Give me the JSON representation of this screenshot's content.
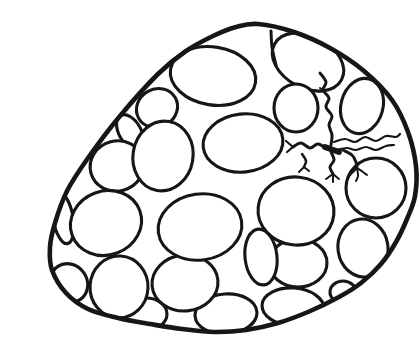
{
  "illustration": {
    "subject": "black-and-white line drawing of an egg sac (ovary cross-section) packed with oval eggs, with small branching vessel squiggles at the upper right",
    "canvas": {
      "width": 380,
      "height": 319
    },
    "colors": {
      "background": "#ffffff",
      "ink": "#161616",
      "egg_fill": "#ffffff"
    },
    "sac_outline": {
      "stroke_width": 4.6,
      "points": [
        [
          218,
          8
        ],
        [
          254,
          16
        ],
        [
          290,
          32
        ],
        [
          324,
          55
        ],
        [
          352,
          84
        ],
        [
          368,
          116
        ],
        [
          376,
          150
        ],
        [
          375,
          180
        ],
        [
          367,
          203
        ],
        [
          356,
          226
        ],
        [
          341,
          248
        ],
        [
          321,
          267
        ],
        [
          299,
          281
        ],
        [
          268,
          296
        ],
        [
          238,
          307
        ],
        [
          206,
          314
        ],
        [
          174,
          316
        ],
        [
          142,
          313
        ],
        [
          110,
          308
        ],
        [
          78,
          302
        ],
        [
          48,
          293
        ],
        [
          26,
          277
        ],
        [
          12,
          254
        ],
        [
          10,
          231
        ],
        [
          15,
          207
        ],
        [
          27,
          175
        ],
        [
          48,
          142
        ],
        [
          80,
          100
        ],
        [
          118,
          58
        ],
        [
          146,
          35
        ],
        [
          173,
          20
        ],
        [
          196,
          11
        ]
      ]
    },
    "eggs": {
      "stroke_width": 3.1,
      "items": [
        {
          "cx": 90,
          "cy": 116,
          "rx": 11,
          "ry": 19,
          "rot": -30
        },
        {
          "cx": 117,
          "cy": 92,
          "rx": 21,
          "ry": 19,
          "rot": -30
        },
        {
          "cx": 173,
          "cy": 60,
          "rx": 43,
          "ry": 29,
          "rot": 9
        },
        {
          "cx": 268,
          "cy": 46,
          "rx": 38,
          "ry": 26,
          "rot": 28
        },
        {
          "cx": 256,
          "cy": 92,
          "rx": 22,
          "ry": 24,
          "rot": 0
        },
        {
          "cx": 322,
          "cy": 90,
          "rx": 21,
          "ry": 28,
          "rot": 15
        },
        {
          "cx": 23,
          "cy": 202,
          "rx": 10,
          "ry": 26,
          "rot": -10
        },
        {
          "cx": 77,
          "cy": 150,
          "rx": 27,
          "ry": 25,
          "rot": -15
        },
        {
          "cx": 123,
          "cy": 140,
          "rx": 30,
          "ry": 35,
          "rot": 10
        },
        {
          "cx": 203,
          "cy": 127,
          "rx": 40,
          "ry": 29,
          "rot": -6
        },
        {
          "cx": 29,
          "cy": 267,
          "rx": 18,
          "ry": 20,
          "rot": -35
        },
        {
          "cx": 106,
          "cy": 298,
          "rx": 21,
          "ry": 16,
          "rot": 0
        },
        {
          "cx": 79,
          "cy": 271,
          "rx": 29,
          "ry": 31,
          "rot": 3
        },
        {
          "cx": 186,
          "cy": 298,
          "rx": 31,
          "ry": 20,
          "rot": -4
        },
        {
          "cx": 145,
          "cy": 267,
          "rx": 33,
          "ry": 28,
          "rot": -5
        },
        {
          "cx": 258,
          "cy": 247,
          "rx": 29,
          "ry": 24,
          "rot": 0
        },
        {
          "cx": 221,
          "cy": 241,
          "rx": 16,
          "ry": 28,
          "rot": -6
        },
        {
          "cx": 66,
          "cy": 207,
          "rx": 36,
          "ry": 32,
          "rot": -20
        },
        {
          "cx": 160,
          "cy": 211,
          "rx": 42,
          "ry": 33,
          "rot": -8
        },
        {
          "cx": 253,
          "cy": 291,
          "rx": 31,
          "ry": 19,
          "rot": 4
        },
        {
          "cx": 303,
          "cy": 276,
          "rx": 13,
          "ry": 11,
          "rot": 0
        },
        {
          "cx": 323,
          "cy": 232,
          "rx": 25,
          "ry": 29,
          "rot": -8
        },
        {
          "cx": 256,
          "cy": 195,
          "rx": 38,
          "ry": 34,
          "rot": 6
        },
        {
          "cx": 336,
          "cy": 172,
          "rx": 30,
          "ry": 30,
          "rot": 0
        }
      ]
    },
    "cell_walls": {
      "paths": [
        {
          "w": 3.0,
          "pts": [
            [
              231,
              15
            ],
            [
              232,
              31
            ],
            [
              236,
              49
            ]
          ]
        }
      ]
    },
    "vessels": {
      "paths": [
        {
          "w": 3.0,
          "pts": [
            [
              280,
              57
            ],
            [
              286,
              66
            ],
            [
              283,
              74
            ],
            [
              289,
              82
            ],
            [
              286,
              91
            ],
            [
              292,
              100
            ],
            [
              289,
              109
            ],
            [
              292,
              119
            ],
            [
              291,
              129
            ]
          ]
        },
        {
          "w": 2.0,
          "pts": [
            [
              285,
              76
            ],
            [
              280,
              72
            ]
          ]
        },
        {
          "w": 6.0,
          "pts": [
            [
              285,
              131
            ],
            [
              299,
              136
            ]
          ]
        },
        {
          "w": 2.2,
          "pts": [
            [
              294,
              126
            ],
            [
              305,
              123
            ],
            [
              315,
              126
            ],
            [
              325,
              121
            ],
            [
              336,
              125
            ],
            [
              346,
              120
            ],
            [
              356,
              121
            ],
            [
              360,
              118
            ]
          ]
        },
        {
          "w": 2.2,
          "pts": [
            [
              296,
              134
            ],
            [
              307,
              132
            ],
            [
              316,
              134
            ],
            [
              326,
              131
            ],
            [
              336,
              134
            ],
            [
              346,
              130
            ],
            [
              354,
              129
            ]
          ]
        },
        {
          "w": 3.0,
          "pts": [
            [
              287,
              133
            ],
            [
              278,
              128
            ],
            [
              270,
              132
            ],
            [
              261,
              127
            ],
            [
              253,
              131
            ]
          ]
        },
        {
          "w": 2.2,
          "pts": [
            [
              253,
              131
            ],
            [
              246,
              125
            ]
          ]
        },
        {
          "w": 2.2,
          "pts": [
            [
              253,
              131
            ],
            [
              247,
              136
            ]
          ]
        },
        {
          "w": 3.0,
          "pts": [
            [
              303,
              134
            ],
            [
              312,
              139
            ],
            [
              316,
              146
            ],
            [
              317,
              152
            ]
          ]
        },
        {
          "w": 2.0,
          "pts": [
            [
              317,
              152
            ],
            [
              310,
              159
            ],
            [
              308,
              163
            ]
          ]
        },
        {
          "w": 2.0,
          "pts": [
            [
              317,
              152
            ],
            [
              318,
              160
            ],
            [
              316,
              165
            ]
          ]
        },
        {
          "w": 2.0,
          "pts": [
            [
              317,
              152
            ],
            [
              323,
              156
            ],
            [
              327,
              159
            ]
          ]
        },
        {
          "w": 3.0,
          "pts": [
            [
              291,
              136
            ],
            [
              294,
              144
            ],
            [
              290,
              151
            ],
            [
              293,
              158
            ]
          ]
        },
        {
          "w": 2.0,
          "pts": [
            [
              293,
              158
            ],
            [
              286,
              163
            ]
          ]
        },
        {
          "w": 2.0,
          "pts": [
            [
              293,
              158
            ],
            [
              293,
              166
            ]
          ]
        },
        {
          "w": 2.0,
          "pts": [
            [
              293,
              158
            ],
            [
              299,
              163
            ]
          ]
        },
        {
          "w": 2.5,
          "pts": [
            [
              262,
              138
            ],
            [
              266,
              145
            ],
            [
              264,
              151
            ]
          ]
        },
        {
          "w": 2.0,
          "pts": [
            [
              264,
              151
            ],
            [
              259,
              156
            ]
          ]
        },
        {
          "w": 2.0,
          "pts": [
            [
              264,
              151
            ],
            [
              269,
              155
            ]
          ]
        }
      ]
    }
  }
}
